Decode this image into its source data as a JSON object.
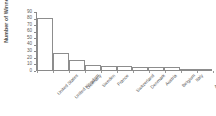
{
  "chart_data": {
    "type": "bar",
    "title": "",
    "xlabel": "",
    "ylabel": "Number of Winners",
    "categories": [
      "United States",
      "United Kingdom",
      "Germany",
      "Sweden",
      "France",
      "Switzerland",
      "Denmark",
      "Austria",
      "Belgium",
      "Italy",
      "Australia"
    ],
    "values": [
      80,
      26,
      16,
      8,
      7,
      6,
      5,
      5,
      4,
      2,
      2
    ],
    "ylim": [
      0,
      90
    ],
    "yticks": [
      0,
      10,
      20,
      30,
      40,
      50,
      60,
      70,
      80,
      90
    ],
    "ytick_labels": [
      "0",
      "10",
      "20",
      "30",
      "40",
      "50",
      "60",
      "70",
      "80",
      "90"
    ],
    "grid": false,
    "legend": null,
    "bar_style": {
      "fill": "#ffffff",
      "edge": "#8d8d8d",
      "axis": "#8a8a8a",
      "text": "#545454"
    }
  }
}
